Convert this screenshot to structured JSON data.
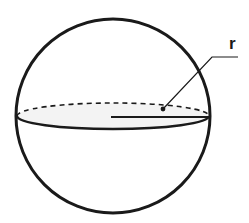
{
  "diagram": {
    "type": "sphere",
    "labels": {
      "radius": "r"
    },
    "colors": {
      "stroke": "#1a1a1a",
      "equator_fill": "#f2f2f2",
      "background": "#ffffff"
    }
  }
}
